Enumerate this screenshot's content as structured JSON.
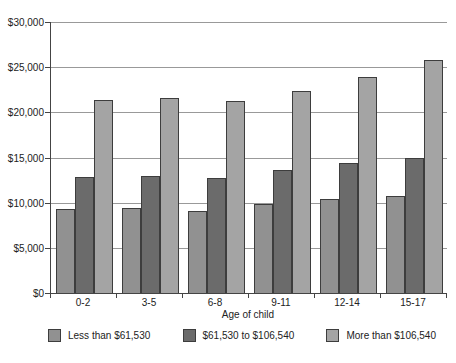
{
  "chart_data": {
    "type": "bar",
    "title": "",
    "categories": [
      "0-2",
      "3-5",
      "6-8",
      "9-11",
      "12-14",
      "15-17"
    ],
    "series": [
      {
        "name": "Less than $61,530",
        "color": "#919191",
        "values": [
          9300,
          9400,
          9100,
          9800,
          10400,
          10700
        ]
      },
      {
        "name": "$61,530 to $106,540",
        "color": "#6b6b6b",
        "values": [
          12800,
          12900,
          12700,
          13600,
          14400,
          15000
        ]
      },
      {
        "name": "More than $106,540",
        "color": "#a4a4a4",
        "values": [
          21400,
          21600,
          21300,
          22400,
          23900,
          25800
        ]
      }
    ],
    "xlabel": "Age of child",
    "ylabel": "",
    "ylim": [
      0,
      30000
    ],
    "ytick_interval": 5000,
    "ytick_labels": [
      "$0",
      "$5,000",
      "$10,000",
      "$15,000",
      "$20,000",
      "$25,000",
      "$30,000"
    ],
    "grid": true,
    "legend_position": "bottom",
    "colors": {
      "axis": "#444444",
      "gridline": "#999999",
      "text": "#222222",
      "bar_border": "#3d3d3d",
      "background": "#ffffff"
    }
  }
}
